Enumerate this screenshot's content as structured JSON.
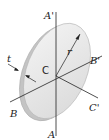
{
  "diagram": {
    "labels": {
      "axis_a_top": "A'",
      "axis_a_bottom": "A",
      "axis_b_left": "B",
      "axis_b_right": "B'",
      "axis_c_right": "C'",
      "center": "C",
      "radius": "r",
      "thickness": "t"
    },
    "colors": {
      "disk_face": "#e6e6e6",
      "disk_rim": "#c8c8c8",
      "lines": "#222222"
    }
  }
}
